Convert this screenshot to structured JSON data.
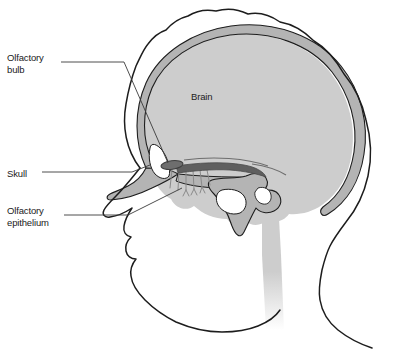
{
  "figure": {
    "type": "anatomical-diagram",
    "background_color": "#ffffff"
  },
  "colors": {
    "outline": "#1d1d1d",
    "skull_bone": "#b4b4b4",
    "brain": "#cdcdcd",
    "olfactory_bulb": "#6e6e6e",
    "nerve_fiber": "#8a8a8a",
    "leader_line": "#3a3a3a",
    "text": "#1a1a1a",
    "background": "#ffffff"
  },
  "labels": [
    {
      "id": "olfactory-bulb",
      "text": "Olfactory\nbulb",
      "lines": [
        "Olfactory",
        "bulb"
      ],
      "x": 7,
      "y": 52
    },
    {
      "id": "skull",
      "text": "Skull",
      "lines": [
        "Skull"
      ],
      "x": 7,
      "y": 168
    },
    {
      "id": "olfactory-epithelium",
      "text": "Olfactory\nepithelium",
      "lines": [
        "Olfactory",
        "epithelium"
      ],
      "x": 7,
      "y": 205
    },
    {
      "id": "brain",
      "text": "Brain",
      "lines": [
        "Brain"
      ],
      "x": 191,
      "y": 91
    }
  ],
  "structures": [
    {
      "id": "scalp-head-outline",
      "name": "Head and face profile outline",
      "fill": "none",
      "stroke": "#1d1d1d"
    },
    {
      "id": "skull-bone",
      "name": "Skull bone (cranial vault and base)",
      "fill": "#b4b4b4",
      "stroke": "#1d1d1d"
    },
    {
      "id": "brain-mass",
      "name": "Brain (cerebrum and cerebellum)",
      "fill": "#cdcdcd",
      "stroke": "none"
    },
    {
      "id": "brainstem",
      "name": "Brainstem and spinal cord",
      "fill": "#cdcdcd",
      "stroke": "none"
    },
    {
      "id": "olfactory-bulb-body",
      "name": "Olfactory bulb and tract",
      "fill": "#6e6e6e",
      "stroke": "#4a4a4a"
    },
    {
      "id": "olfactory-nerve-fibers",
      "name": "Olfactory nerve filaments through cribriform plate",
      "fill": "none",
      "stroke": "#8a8a8a"
    },
    {
      "id": "nasal-conchae",
      "name": "Nasal cavity and conchae",
      "fill": "#b4b4b4",
      "stroke": "#1d1d1d"
    },
    {
      "id": "sphenoid-bone",
      "name": "Sphenoid bone with sinus",
      "fill": "#b4b4b4",
      "stroke": "#1d1d1d"
    }
  ],
  "leader_lines": [
    {
      "id": "leader-olfactory-bulb",
      "from_label": "olfactory-bulb",
      "to_structure": "olfactory-bulb-body"
    },
    {
      "id": "leader-skull",
      "from_label": "skull",
      "to_structure": "skull-bone"
    },
    {
      "id": "leader-olfactory-epithelium",
      "from_label": "olfactory-epithelium",
      "to_structure": "olfactory-nerve-fibers"
    }
  ]
}
